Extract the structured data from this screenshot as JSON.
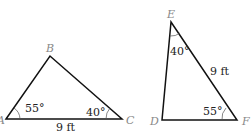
{
  "triangle_1": {
    "vertices": {
      "A": "A",
      "B": "B",
      "C": "C"
    },
    "angle_A": "55°",
    "angle_C": "40°",
    "side_AC": "9 ft"
  },
  "triangle_2": {
    "vertices": {
      "D": "D",
      "E": "E",
      "F": "F"
    },
    "angle_E": "40°",
    "angle_F": "55°",
    "side_EF": "9 ft"
  }
}
